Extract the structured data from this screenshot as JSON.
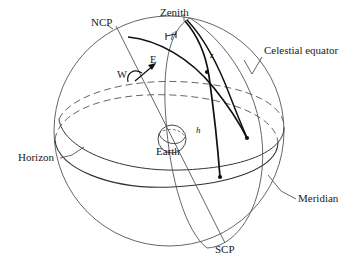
{
  "figure": {
    "type": "astronomical-diagram",
    "background_color": "#ffffff",
    "line_color": "#1a1a1a",
    "thin_line_color": "#444444"
  },
  "labels": {
    "ncp": "NCP",
    "zenith": "Zenith",
    "celestial_equator": "Celestial equator",
    "meridian": "Meridian",
    "horizon": "Horizon",
    "earth": "Earth",
    "scp": "SCP",
    "west": "W",
    "east": "E",
    "zenith_distance": "z",
    "altitude": "h",
    "latitude_angle": "f"
  },
  "elements": {
    "celestial_sphere": "outer great circle outline",
    "horizon_circle": "horizon plane ellipse, solid in front, dashed behind",
    "equator_circle": "celestial equator ellipse, solid in front, dashed behind",
    "meridian_circle": "meridian great circle through zenith, NCP and SCP",
    "polar_axis": "line from NCP through Earth to SCP",
    "hour_circle": "great-circle arc through the star",
    "vertical_circle": "arc from zenith through star down to horizon",
    "earth_globe": "small sphere at center with equator ellipse",
    "rotation_arrow": "curved arrow from W to E indicating diurnal rotation",
    "star_markers": "filled dots marking the star and its horizon foot"
  },
  "markers": [
    {
      "name": "star-upper",
      "x": 207,
      "y": 72
    },
    {
      "name": "star-lower",
      "x": 247,
      "y": 138
    },
    {
      "name": "horizon-foot",
      "x": 220,
      "y": 177
    }
  ]
}
